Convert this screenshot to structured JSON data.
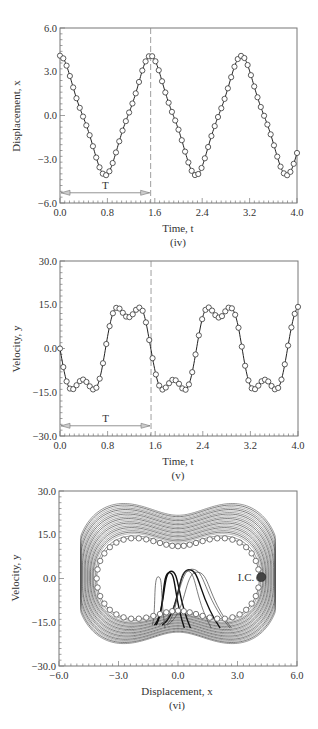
{
  "figure": {
    "captions": [
      "(iv)",
      "(v)",
      "(vi)"
    ]
  },
  "chart_data": [
    {
      "type": "line",
      "id": "iv",
      "caption": "(iv)",
      "title": "",
      "xlabel": "Time, t",
      "ylabel": "Displacement, x",
      "xlim": [
        0.0,
        4.0
      ],
      "ylim": [
        -6.0,
        6.0
      ],
      "xticks": [
        "0.0",
        "0.8",
        "1.6",
        "2.4",
        "3.2",
        "4.0"
      ],
      "yticks": [
        "6.0",
        "3.0",
        "0.0",
        "-3.0",
        "-6.0"
      ],
      "grid": false,
      "markers": "open-circle",
      "annotations": [
        {
          "type": "dashed-vline",
          "x": 1.53
        },
        {
          "type": "double-arrow",
          "x0": 0.0,
          "x1": 1.53,
          "y": -5.3,
          "label": "T"
        }
      ],
      "x": [
        0.0,
        0.1,
        0.2,
        0.3,
        0.4,
        0.5,
        0.6,
        0.7,
        0.8,
        0.9,
        1.0,
        1.1,
        1.2,
        1.3,
        1.4,
        1.5,
        1.6,
        1.7,
        1.8,
        1.9,
        2.0,
        2.1,
        2.2,
        2.3,
        2.4,
        2.5,
        2.6,
        2.7,
        2.8,
        2.9,
        3.0,
        3.1,
        3.2,
        3.3,
        3.4,
        3.5,
        3.6,
        3.7,
        3.8,
        3.9,
        4.0
      ],
      "series": [
        {
          "name": "Displacement x(t)",
          "values": [
            4.1,
            3.54,
            2.24,
            0.91,
            -0.19,
            -1.35,
            -2.73,
            -3.85,
            -4.03,
            -3.12,
            -1.77,
            -0.51,
            0.57,
            1.82,
            3.23,
            4.06,
            3.81,
            2.66,
            1.29,
            0.13,
            -0.97,
            -2.32,
            -3.59,
            -4.1,
            -3.48,
            -2.16,
            -0.86,
            0.26,
            1.42,
            2.78,
            3.87,
            4.0,
            3.06,
            1.69,
            0.46,
            -0.62,
            -1.89,
            -3.25,
            -4.06,
            -3.78,
            -2.57
          ]
        }
      ]
    },
    {
      "type": "line",
      "id": "v",
      "caption": "(v)",
      "title": "",
      "xlabel": "Time, t",
      "ylabel": "Velocity, y",
      "xlim": [
        0.0,
        4.0
      ],
      "ylim": [
        -30.0,
        30.0
      ],
      "xticks": [
        "0.0",
        "0.8",
        "1.6",
        "2.4",
        "3.2",
        "4.0"
      ],
      "yticks": [
        "30.0",
        "15.0",
        "0.0",
        "-15.0",
        "-30.0"
      ],
      "grid": false,
      "markers": "open-circle",
      "annotations": [
        {
          "type": "dashed-vline",
          "x": 1.53
        },
        {
          "type": "double-arrow",
          "x0": 0.0,
          "x1": 1.53,
          "y": -26.5,
          "label": "T"
        }
      ],
      "x": [
        0.0,
        0.1,
        0.2,
        0.3,
        0.4,
        0.5,
        0.6,
        0.7,
        0.8,
        0.9,
        1.0,
        1.1,
        1.2,
        1.3,
        1.4,
        1.5,
        1.6,
        1.7,
        1.8,
        1.9,
        2.0,
        2.1,
        2.2,
        2.3,
        2.4,
        2.5,
        2.6,
        2.7,
        2.8,
        2.9,
        3.0,
        3.1,
        3.2,
        3.3,
        3.4,
        3.5,
        3.6,
        3.7,
        3.8,
        3.9,
        4.0
      ],
      "series": [
        {
          "name": "Velocity y(t)",
          "values": [
            0.0,
            -10.51,
            -14.13,
            -11.95,
            -10.67,
            -12.96,
            -13.79,
            -7.44,
            4.16,
            12.69,
            13.67,
            11.11,
            11.18,
            13.73,
            12.45,
            2.9,
            -7.88,
            -13.87,
            -12.81,
            -10.64,
            -12.1,
            -14.24,
            -10.11,
            0.6,
            10.95,
            14.07,
            11.69,
            10.64,
            13.44,
            13.5,
            7.12,
            -4.71,
            -12.93,
            -13.59,
            -11.0,
            -11.3,
            -13.87,
            -12.18,
            -2.92,
            8.32,
            14.27
          ]
        }
      ]
    },
    {
      "type": "scatter",
      "id": "vi",
      "caption": "(vi)",
      "title": "",
      "xlabel": "Displacement, x",
      "ylabel": "Velocity, y",
      "xlim": [
        -6.0,
        6.0
      ],
      "ylim": [
        -30.0,
        30.0
      ],
      "xticks": [
        "-6.0",
        "-3.0",
        "0.0",
        "3.0",
        "6.0"
      ],
      "yticks": [
        "30.0",
        "15.0",
        "0.0",
        "-15.0",
        "-30.0"
      ],
      "grid": false,
      "description": "Phase-plane trajectory: dense chaotic orbit lines (twin-lobe) with periodic orbit shown as open circles",
      "annotations": [
        {
          "type": "filled-marker",
          "x": 4.2,
          "y": 0.5,
          "label": "I.C."
        }
      ],
      "periodic_orbit_markers": "uses (x, y) pairs from series (iv) and (v)",
      "orbit_envelope": {
        "outer_x_max": 4.9,
        "outer_y_max": 27.0,
        "outer_y_min": -25.0,
        "inner_top_y": 8.0,
        "loop_x_centers": [
          -0.4,
          0.6
        ],
        "loop_y_top": 2.5
      },
      "orbit_scales": [
        1.0,
        1.03,
        1.06,
        1.08,
        1.1,
        1.12,
        1.14,
        1.16,
        1.18,
        1.2,
        1.22,
        1.24,
        1.26,
        1.28,
        1.3,
        1.32,
        1.34,
        1.36,
        1.38,
        1.4,
        1.42,
        1.44,
        1.46
      ]
    }
  ]
}
